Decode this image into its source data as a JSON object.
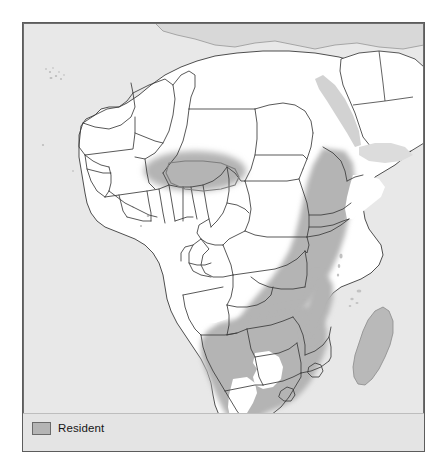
{
  "map": {
    "title": "Africa distribution map",
    "projection_region": "Africa and Arabian Peninsula",
    "colors": {
      "resident_fill": "#b4b4b4",
      "non_range_land": "#ffffff",
      "sea_and_outside": "#e8e8e8",
      "border_stroke": "#3b3b3b",
      "frame_stroke": "#5c5c5c",
      "legend_strip": "#e4e4e4"
    },
    "legend": {
      "items": [
        {
          "swatch_name": "resident-swatch",
          "label": "Resident",
          "color": "#b4b4b4"
        }
      ]
    },
    "range_regions": [
      {
        "name": "lake-chad-sahel-patch",
        "description": "Isolated oval patch spanning southern Chad and northeastern Nigeria"
      },
      {
        "name": "east-african-belt",
        "description": "Diagonal belt from Eritrea and Ethiopia south through Uganda, Kenya and Tanzania"
      },
      {
        "name": "southern-african-block",
        "description": "Zambia, Malawi, Mozambique, Zimbabwe, Botswana, Namibia and eastern South Africa"
      },
      {
        "name": "kalahari-gap",
        "description": "Unshaded gap in central Botswana and the western interior of South Africa"
      }
    ],
    "unshaded_notes": [
      "North Africa and the Sahara are outside the range",
      "West Africa and the Congo Basin are outside the range",
      "Somalia and the Horn tip are outside the range",
      "Madagascar is drawn in the neutral out-of-range tone"
    ]
  }
}
